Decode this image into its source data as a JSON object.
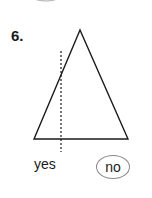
{
  "problem": {
    "number": "6.",
    "options": [
      "yes",
      "no"
    ],
    "selected": "no",
    "figure": "triangle-with-dotted-line"
  }
}
